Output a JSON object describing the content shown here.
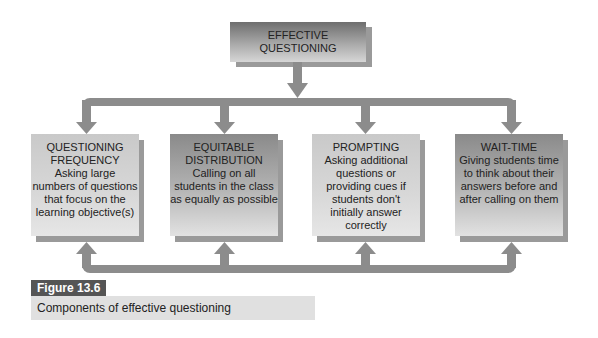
{
  "diagram": {
    "root": {
      "line1": "EFFECTIVE",
      "line2": "QUESTIONING"
    },
    "components": [
      {
        "title1": "QUESTIONING",
        "title2": "FREQUENCY",
        "desc": [
          "Asking large",
          "numbers of questions",
          "that focus on the",
          "learning objective(s)"
        ]
      },
      {
        "title1": "EQUITABLE",
        "title2": "DISTRIBUTION",
        "desc": [
          "Calling on all",
          "students in the class",
          "as equally as possible"
        ]
      },
      {
        "title1": "PROMPTING",
        "title2": "",
        "desc": [
          "Asking additional",
          "questions or",
          "providing cues if",
          "students don't",
          "initially answer",
          "correctly"
        ]
      },
      {
        "title1": "WAIT-TIME",
        "title2": "",
        "desc": [
          "Giving students time",
          "to think about their",
          "answers before and",
          "after calling on them"
        ]
      }
    ]
  },
  "figure": {
    "label": "Figure 13.6",
    "caption": "Components of effective questioning"
  },
  "colors": {
    "connector": "#8c8c8c",
    "label_bg": "#555555",
    "caption_bg": "#e0e0e0"
  }
}
